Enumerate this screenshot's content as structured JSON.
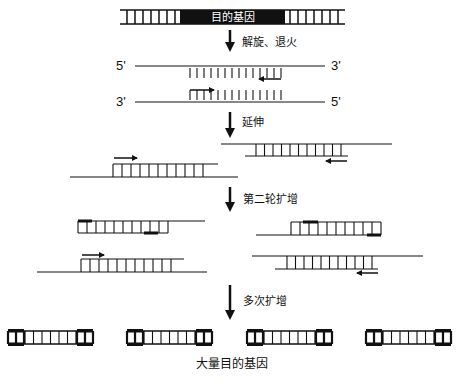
{
  "colors": {
    "ink": "#111111",
    "gene_fill": "#111111",
    "gene_text": "#ffffff",
    "background": "#ffffff"
  },
  "top_dna": {
    "label": "目的基因",
    "x1": 120,
    "x2": 345,
    "y_top": 10,
    "y_bot": 24,
    "black_x1": 180,
    "black_x2": 285,
    "rungs_left": [
      127,
      135,
      143,
      151,
      159,
      167,
      175
    ],
    "rungs_right": [
      290,
      298,
      306,
      314,
      322,
      330,
      338
    ]
  },
  "steps": [
    {
      "label": "解旋、退火",
      "arrow_x": 230,
      "y1": 30,
      "y2": 52,
      "text_x": 242,
      "text_y": 46
    },
    {
      "label": "延伸",
      "arrow_x": 230,
      "y1": 112,
      "y2": 138,
      "text_x": 242,
      "text_y": 126
    },
    {
      "label": "第二轮扩增",
      "arrow_x": 230,
      "y1": 187,
      "y2": 212,
      "text_x": 243,
      "text_y": 203
    },
    {
      "label": "多次扩增",
      "arrow_x": 230,
      "y1": 285,
      "y2": 320,
      "text_x": 243,
      "text_y": 305
    }
  ],
  "denatured": {
    "strand_top": {
      "left_label": "5'",
      "right_label": "3'",
      "y": 66,
      "x1": 135,
      "x2": 325,
      "label_left_x": 116,
      "label_right_x": 331
    },
    "strand_bottom": {
      "left_label": "3'",
      "right_label": "5'",
      "y": 102,
      "x1": 135,
      "x2": 325,
      "label_left_x": 116,
      "label_right_x": 331
    },
    "rungs_x": [
      190,
      197,
      204,
      211,
      218,
      225,
      232,
      239,
      246,
      253,
      260,
      267,
      274,
      281
    ],
    "primer_fwd": {
      "x1": 190,
      "x2": 214,
      "y": 90
    },
    "primer_rev": {
      "x1": 281,
      "x2": 259,
      "y": 79
    }
  },
  "extension": {
    "left": {
      "template_y": 177,
      "template_x1": 70,
      "template_x2": 238,
      "new_y": 164,
      "new_x1": 113,
      "new_x2": 218,
      "rung_end": 203,
      "arrow": {
        "x1": 114,
        "x2": 137,
        "y": 158
      }
    },
    "right": {
      "template_y": 144,
      "template_x1": 221,
      "template_x2": 392,
      "new_y": 156,
      "new_x1": 245,
      "new_x2": 348,
      "rung_start": 256,
      "arrow": {
        "x1": 347,
        "x2": 326,
        "y": 161
      }
    }
  },
  "round2": {
    "a": {
      "top_y": 221,
      "bot_y": 233,
      "box_x1": 78,
      "box_x2": 168,
      "line_x2": 205,
      "mark_top": [
        78,
        92
      ],
      "mark_bot": [
        144,
        158
      ]
    },
    "b": {
      "top_y": 222,
      "bot_y": 235,
      "box_x1": 291,
      "box_x2": 381,
      "line_x1": 256,
      "mark_top": [
        303,
        318
      ],
      "mark_bot": [
        367,
        381
      ]
    },
    "c": {
      "template_y": 272,
      "template_x1": 37,
      "template_x2": 207,
      "new_y": 259,
      "new_x1": 81,
      "new_x2": 184,
      "rung_end": 172,
      "arrow": {
        "x1": 82,
        "x2": 104,
        "y": 255
      }
    },
    "d": {
      "template_y": 256,
      "template_x1": 252,
      "template_x2": 423,
      "new_y": 269,
      "new_x1": 275,
      "new_x2": 378,
      "rung_start": 287,
      "arrow": {
        "x1": 378,
        "x2": 357,
        "y": 273
      }
    }
  },
  "products": {
    "y_top": 331,
    "y_bot": 344,
    "items": [
      {
        "x": 8
      },
      {
        "x": 127
      },
      {
        "x": 247
      },
      {
        "x": 366
      }
    ],
    "width": 85,
    "cap": 16
  },
  "result_label": {
    "text": "大量目的基因",
    "x": 232,
    "y": 368
  }
}
